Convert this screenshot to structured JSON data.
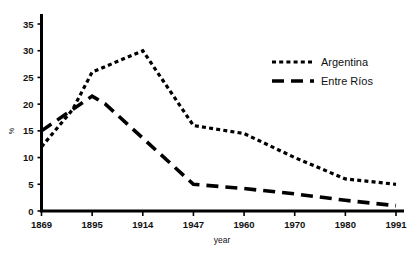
{
  "chart_data": {
    "type": "line",
    "title": "",
    "xlabel": "year",
    "ylabel": "%",
    "categories": [
      "1869",
      "1895",
      "1914",
      "1947",
      "1960",
      "1970",
      "1980",
      "1991"
    ],
    "ylim": [
      0,
      35
    ],
    "yticks": [
      0,
      5,
      10,
      15,
      20,
      25,
      30,
      35
    ],
    "grid": false,
    "legend_position": "top-right",
    "series": [
      {
        "name": "Argentina",
        "style": "dotted",
        "color": "#000000",
        "points": [
          {
            "x": "1869",
            "y": 12
          },
          {
            "x": "1885",
            "y": 19
          },
          {
            "x": "1895",
            "y": 26
          },
          {
            "x": "1914",
            "y": 30
          },
          {
            "x": "1947",
            "y": 16
          },
          {
            "x": "1960",
            "y": 14.5
          },
          {
            "x": "1970",
            "y": 10
          },
          {
            "x": "1980",
            "y": 6
          },
          {
            "x": "1991",
            "y": 5
          }
        ]
      },
      {
        "name": "Entre Ríos",
        "style": "dashed",
        "color": "#000000",
        "points": [
          {
            "x": "1869",
            "y": 15
          },
          {
            "x": "1885",
            "y": 19
          },
          {
            "x": "1895",
            "y": 21.5
          },
          {
            "x": "1900",
            "y": 20
          },
          {
            "x": "1947",
            "y": 5
          },
          {
            "x": "1960",
            "y": 4.2
          },
          {
            "x": "1970",
            "y": 3.2
          },
          {
            "x": "1980",
            "y": 2
          },
          {
            "x": "1991",
            "y": 1
          }
        ]
      }
    ]
  },
  "legend": {
    "entries": [
      {
        "label": "Argentina",
        "style": "dotted"
      },
      {
        "label": "Entre Ríos",
        "style": "dashed"
      }
    ]
  },
  "axes": {
    "x_title": "year",
    "y_title": "%",
    "x_tick_labels": [
      "1869",
      "1895",
      "1914",
      "1947",
      "1960",
      "1970",
      "1980",
      "1991"
    ],
    "y_tick_labels": [
      "0",
      "5",
      "10",
      "15",
      "20",
      "25",
      "30",
      "35"
    ]
  }
}
